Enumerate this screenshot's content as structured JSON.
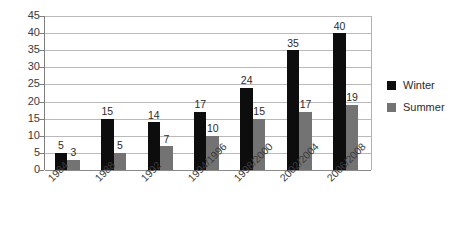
{
  "chart_data": {
    "type": "bar",
    "title": "",
    "xlabel": "",
    "ylabel": "",
    "categories": [
      "1984",
      "1988",
      "1992",
      "1994/1996",
      "1998/2000",
      "2002/2004",
      "2006/2008"
    ],
    "series": [
      {
        "name": "Winter",
        "color": "#0d0d0d",
        "values": [
          5,
          15,
          14,
          17,
          24,
          35,
          40
        ]
      },
      {
        "name": "Summer",
        "color": "#737373",
        "values": [
          3,
          5,
          7,
          10,
          15,
          17,
          19
        ]
      }
    ],
    "ylim": [
      0,
      45
    ],
    "ytick_values": [
      0,
      5,
      10,
      15,
      20,
      25,
      30,
      35,
      40,
      45
    ],
    "ytick_labels": [
      "0",
      "5",
      "10",
      "15",
      "20",
      "25",
      "30",
      "35",
      "40",
      "45"
    ],
    "grid": true,
    "data_labels": true,
    "legend_position": "right"
  },
  "legend": {
    "entries": [
      {
        "label": "Winter",
        "color": "#0d0d0d"
      },
      {
        "label": "Summer",
        "color": "#737373"
      }
    ]
  }
}
